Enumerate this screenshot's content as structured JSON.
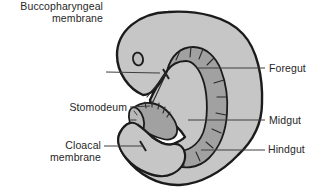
{
  "labels": {
    "buccopharyngeal_membrane": {
      "line1": "Buccopharyngeal",
      "line2": "membrane"
    },
    "stomodeum": "Stomodeum",
    "cloacal_membrane": {
      "line1": "Cloacal",
      "line2": "membrane"
    },
    "foregut": "Foregut",
    "midgut": "Midgut",
    "hindgut": "Hindgut"
  },
  "colors": {
    "background": "#ffffff",
    "body_fill": "#c6c6c6",
    "gut_fill": "#a1a1a1",
    "tube_lumen": "#b9b9b9",
    "optic_fill": "#bdbdbd",
    "outline": "#1b1b1b",
    "leader_line": "#3f3f3f",
    "label_text": "#272727"
  }
}
